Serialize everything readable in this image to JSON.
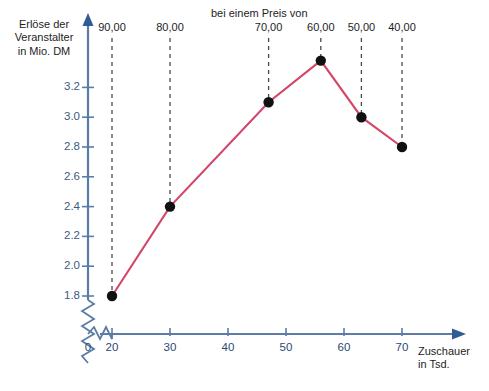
{
  "chart_data": {
    "type": "line",
    "title": "",
    "xlabel": "Zuschauer in Tsd.",
    "ylabel": "Erlöse der Veranstalter in Mio. DM",
    "x": [
      20,
      30,
      47,
      56,
      63,
      70
    ],
    "values": [
      1.8,
      2.4,
      3.1,
      3.38,
      3.0,
      2.8
    ],
    "point_labels": [
      "90,00",
      "80,00",
      "70,00",
      "60,00",
      "50,00",
      "40,00"
    ],
    "annotation": "bei einem Preis von",
    "xlim": [
      20,
      76
    ],
    "ylim": [
      1.7,
      3.45
    ],
    "xticks": [
      20,
      30,
      40,
      50,
      60,
      70
    ],
    "xtick_labels": [
      "20",
      "30",
      "40",
      "50",
      "60",
      "70"
    ],
    "origin_label": "0",
    "yticks": [
      1.8,
      2.0,
      2.2,
      2.4,
      2.6,
      2.8,
      3.0,
      3.2
    ],
    "ytick_labels": [
      "1.8",
      "2.0",
      "2.2",
      "2.4",
      "2.6",
      "2.8",
      "3.0",
      "3.2"
    ],
    "grid": false,
    "legend": "none",
    "series_color": "#d44668",
    "axis_color": "#5a7ca6",
    "marker_color": "#111111",
    "dash_color": "#4a4a4a"
  },
  "axes": {
    "y_title_lines": [
      "Erlöse der",
      "Veranstalter",
      "in Mio. DM"
    ],
    "x_title_lines": [
      "Zuschauer",
      "in Tsd."
    ]
  },
  "annotations": {
    "price_header": "bei einem Preis von"
  }
}
